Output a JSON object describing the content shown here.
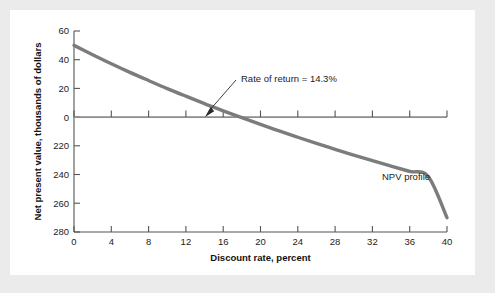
{
  "chart_data": {
    "type": "line",
    "title": "",
    "xlabel": "Discount rate, percent",
    "ylabel": "Net present value, thousands of dollars",
    "xlim": [
      0,
      40
    ],
    "ylim": [
      -80,
      60
    ],
    "grid": false,
    "legend_position": "inline-label",
    "xticks": [
      "0",
      "4",
      "8",
      "12",
      "16",
      "20",
      "24",
      "28",
      "32",
      "36",
      "40"
    ],
    "xtick_values": [
      0,
      4,
      8,
      12,
      16,
      20,
      24,
      28,
      32,
      36,
      40
    ],
    "yticks": [
      "60",
      "40",
      "20",
      "0",
      "220",
      "240",
      "260",
      "280"
    ],
    "ytick_values": [
      60,
      40,
      20,
      0,
      -20,
      -40,
      -60,
      -80
    ],
    "series": [
      {
        "name": "NPV profile",
        "x": [
          0,
          2,
          4,
          6,
          8,
          10,
          12,
          14,
          14.3,
          16,
          18,
          20,
          22,
          24,
          26,
          28,
          30,
          32,
          34,
          36,
          38,
          40
        ],
        "values": [
          50,
          43.5,
          37.2,
          31.2,
          25.5,
          19.9,
          14.6,
          9.4,
          8.6,
          4.4,
          -0.4,
          -5.1,
          -9.6,
          -14.0,
          -18.3,
          -22.4,
          -26.4,
          -30.3,
          -34.1,
          -37.8,
          -41.4,
          -70.0
        ]
      }
    ],
    "annotations": [
      {
        "name": "rate-of-return",
        "text": "Rate of return = 14.3%",
        "points_to_x": 14.3,
        "points_to_y": 0
      },
      {
        "name": "series-inline-label",
        "text": "NPV profile"
      }
    ]
  },
  "figure": {
    "background_color": "#ebebeb",
    "panel_color": "#ffffff",
    "curve_color": "#7c7c7c",
    "axis_color": "#555555",
    "zero_line_color": "#8d8d8d",
    "text_color": "#1c1c1c"
  }
}
